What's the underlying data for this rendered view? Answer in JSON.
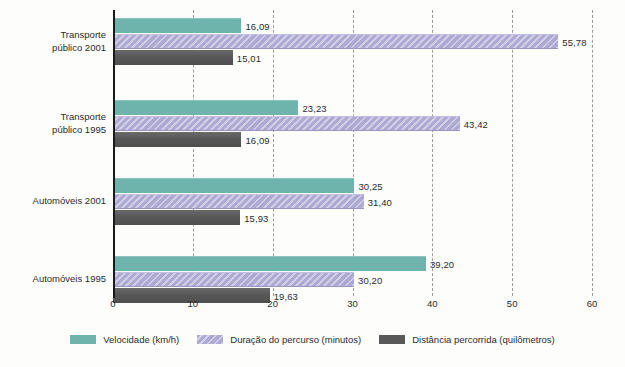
{
  "chart_data": {
    "type": "bar",
    "orientation": "horizontal",
    "title": "",
    "subtitle": "",
    "xlabel": "",
    "ylabel": "",
    "xlim": [
      0,
      60
    ],
    "xticks": [
      0,
      10,
      20,
      30,
      40,
      50,
      60
    ],
    "xtick_labels": [
      "0",
      "10",
      "20",
      "30",
      "40",
      "50",
      "60"
    ],
    "grid": true,
    "grid_axis": "x",
    "grid_style": "dashed",
    "legend_position": "bottom",
    "decimal_separator": ",",
    "categories": [
      "Transporte\npúblico 2001",
      "Transporte\npúblico 1995",
      "Automóveis 2001",
      "Automóveis 1995"
    ],
    "series": [
      {
        "name": "Velocidade (km/h)",
        "color": "#6eb4ac",
        "values": [
          16.09,
          23.23,
          30.25,
          39.2
        ],
        "labels": [
          "16,09",
          "23,23",
          "30,25",
          "39,20"
        ]
      },
      {
        "name": "Duração do percurso (minutos)",
        "color": "#aea9d2",
        "values": [
          55.78,
          43.42,
          31.4,
          30.2
        ],
        "labels": [
          "55,78",
          "43,42",
          "31,40",
          "30,20"
        ]
      },
      {
        "name": "Distância percorrida (quilômetros)",
        "color": "#585858",
        "values": [
          15.01,
          16.09,
          15.93,
          19.63
        ],
        "labels": [
          "15,01",
          "16,09",
          "15,93",
          "19,63"
        ]
      }
    ]
  },
  "legend": {
    "items": [
      {
        "label": "Velocidade (km/h)",
        "key": "velocidade"
      },
      {
        "label": "Duração do percurso (minutos)",
        "key": "duracao"
      },
      {
        "label": "Distância percorrida (quilômetros)",
        "key": "distancia"
      }
    ]
  }
}
